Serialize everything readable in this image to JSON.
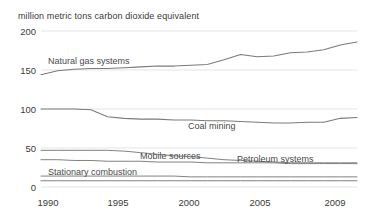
{
  "chart_data": {
    "type": "line",
    "title": "million metric tons carbon dioxide equivalent",
    "xlabel": "",
    "ylabel": "million metric tons carbon dioxide equivalent",
    "xlim": [
      1990,
      2009
    ],
    "ylim": [
      0,
      200
    ],
    "yticks": [
      0,
      50,
      100,
      150,
      200
    ],
    "xticks": [
      1990,
      1995,
      2000,
      2005,
      2009
    ],
    "xtick_labels": [
      "1990",
      "1995",
      "2000",
      "2005",
      "2009"
    ],
    "ytick_labels": [
      "0",
      "50",
      "100",
      "150",
      "200"
    ],
    "grid": true,
    "grid_axis": "y",
    "legend": "inline-labels",
    "x": [
      1990,
      1991,
      1992,
      1993,
      1994,
      1995,
      1996,
      1997,
      1998,
      1999,
      2000,
      2001,
      2002,
      2003,
      2004,
      2005,
      2006,
      2007,
      2008,
      2009
    ],
    "series": [
      {
        "name": "Natural gas systems",
        "label": "Natural gas systems",
        "values": [
          144,
          149,
          151,
          152,
          152,
          153,
          154,
          155,
          155,
          156,
          157,
          163,
          170,
          167,
          168,
          172,
          173,
          176,
          182,
          186
        ]
      },
      {
        "name": "Coal mining",
        "label": "Coal mining",
        "values": [
          100,
          100,
          100,
          99,
          90,
          88,
          87,
          87,
          86,
          86,
          85,
          85,
          84,
          83,
          82,
          82,
          83,
          83,
          88,
          89
        ]
      },
      {
        "name": "Mobile sources",
        "label": "Mobile sources",
        "values": [
          47,
          47,
          47,
          47,
          47,
          46,
          44,
          42,
          40,
          39,
          37,
          35,
          34,
          33,
          32,
          31,
          31,
          31,
          31,
          31
        ]
      },
      {
        "name": "Petroleum systems",
        "label": "Petroleum systems",
        "values": [
          35,
          35,
          34,
          34,
          33,
          33,
          33,
          32,
          32,
          32,
          31,
          31,
          31,
          31,
          31,
          30,
          30,
          30,
          30,
          30
        ]
      },
      {
        "name": "Stationary combustion",
        "label": "Stationary combustion",
        "values": [
          8,
          8,
          8,
          8,
          8,
          8,
          8,
          8,
          8,
          8,
          8,
          8,
          8,
          8,
          8,
          8,
          8,
          8,
          8,
          8
        ]
      },
      {
        "name": "Other low series",
        "label": "",
        "values": [
          14,
          14,
          14,
          14,
          14,
          14,
          14,
          14,
          14,
          13,
          13,
          13,
          13,
          13,
          13,
          13,
          13,
          13,
          13,
          13
        ]
      }
    ],
    "series_label_positions": [
      {
        "label": "Natural gas systems",
        "x": 48,
        "y": 56
      },
      {
        "label": "Coal mining",
        "x": 188,
        "y": 121
      },
      {
        "label": "Mobile sources",
        "x": 140,
        "y": 151
      },
      {
        "label": "Petroleum systems",
        "x": 237,
        "y": 154
      },
      {
        "label": "Stationary combustion",
        "x": 48,
        "y": 167
      }
    ],
    "colors": {
      "line": "#7a7a7a",
      "grid": "#d9d9d9",
      "text": "#3a3a3a"
    }
  }
}
